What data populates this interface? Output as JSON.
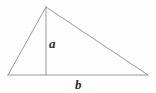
{
  "figure": {
    "background_color": "#fefefe",
    "stroke_color": "#9a9a9a",
    "label_color": "#2b2b2b",
    "stroke_width": 1
  },
  "labels": {
    "height_label": "a",
    "base_label": "b"
  },
  "geometry": {
    "apex": {
      "x": 46,
      "y": 7
    },
    "left_vertex": {
      "x": 8,
      "y": 75
    },
    "right_vertex": {
      "x": 148,
      "y": 75
    },
    "altitude_foot": {
      "x": 46,
      "y": 75
    },
    "left_edge": "M 46 7 L 8 75",
    "right_edge": "M 46 7 L 148 75",
    "base_edge": "M 8 75 L 148 75",
    "altitude_line": "M 46 7 L 46 75"
  }
}
